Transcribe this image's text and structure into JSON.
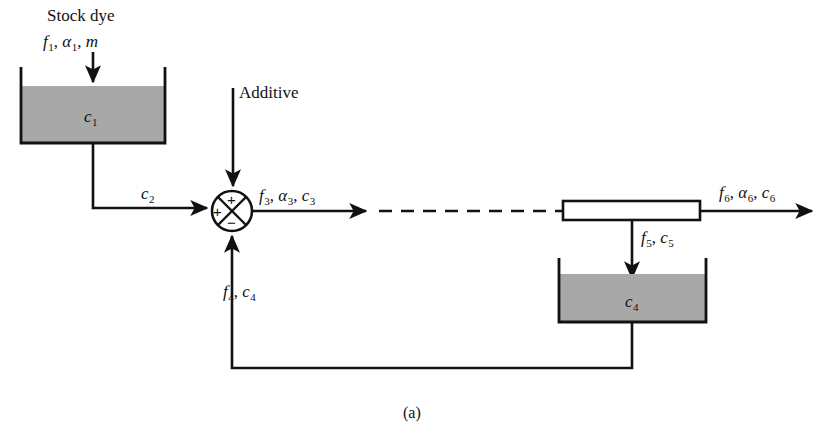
{
  "figure": {
    "caption": "(a)",
    "type": "process-flow-diagram"
  },
  "colors": {
    "line": "#111111",
    "liquid_fill": "#a8a8a8",
    "background": "#ffffff"
  },
  "labels": {
    "stock_dye": "Stock dye",
    "stock_dye_vars": {
      "f": "f",
      "f_sub": "1",
      "alpha": "α",
      "alpha_sub": "1",
      "m": "m"
    },
    "additive": "Additive",
    "tank1_conc": {
      "c": "c",
      "sub": "1"
    },
    "tank2_conc": {
      "c": "c",
      "sub": "4"
    },
    "stream2": {
      "c": "c",
      "sub": "2"
    },
    "stream3": {
      "f": "f",
      "f_sub": "3",
      "alpha": "α",
      "alpha_sub": "3",
      "c": "c",
      "c_sub": "3"
    },
    "stream4": {
      "f": "f",
      "f_sub": "4",
      "c": "c",
      "c_sub": "4"
    },
    "stream5": {
      "f": "f",
      "f_sub": "5",
      "c": "c",
      "c_sub": "5"
    },
    "stream6": {
      "f": "f",
      "f_sub": "6",
      "alpha": "α",
      "alpha_sub": "6",
      "c": "c",
      "c_sub": "6"
    }
  },
  "summing_junction": {
    "signs": {
      "top": "+",
      "left": "+",
      "bottom": "−"
    }
  },
  "elements": {
    "tank1_name": "stock-dye-tank",
    "tank2_name": "collection-tank",
    "mixer_name": "inline-mixer-pipe"
  }
}
